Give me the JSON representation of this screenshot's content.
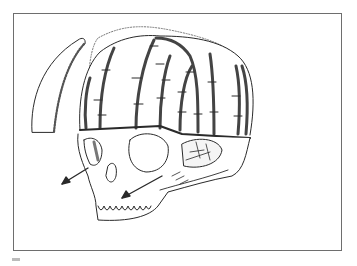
{
  "figure": {
    "type": "medical-line-illustration",
    "colors": {
      "line": "#2a2a2a",
      "frame": "#6e6e6e",
      "background": "#ffffff",
      "shade": "#9a9a9a"
    },
    "elements": [
      "removed-bone-flap",
      "cranial-vault-staves",
      "dotted-original-contour",
      "orbital-bar",
      "skull-face",
      "advancement-arrow-left",
      "advancement-arrow-right"
    ],
    "arrows": 2,
    "staves": 8
  }
}
